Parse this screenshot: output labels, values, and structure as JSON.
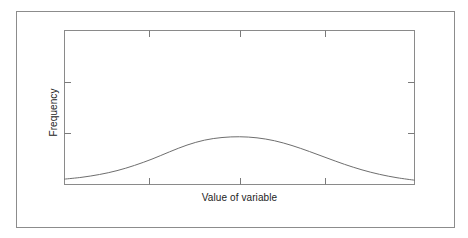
{
  "figure": {
    "background_color": "#ffffff",
    "outer_border_color": "#8c8c8c",
    "axis_color": "#8a8a8a",
    "curve_color": "#6e6e6e",
    "text_color": "#1c1c1c"
  },
  "chart_data": {
    "type": "line",
    "title": "",
    "subtitle": "",
    "xlabel": "Value of variable",
    "ylabel": "Frequency",
    "legend": [],
    "annotations": [],
    "grid": false,
    "frame": "full-box",
    "tick_direction": "in",
    "tick_labels_x": [],
    "tick_labels_y": [],
    "xlim": [
      0,
      1
    ],
    "ylim": [
      0,
      1
    ],
    "x_tick_positions": [
      0.242,
      0.501,
      0.743
    ],
    "y_tick_positions": [
      0.665,
      0.335
    ],
    "series": [
      {
        "name": "frequency distribution",
        "x": [
          0.0,
          0.05,
          0.1,
          0.15,
          0.2,
          0.25,
          0.3,
          0.35,
          0.4,
          0.45,
          0.5,
          0.55,
          0.6,
          0.65,
          0.7,
          0.75,
          0.8,
          0.85,
          0.9,
          0.95,
          1.0
        ],
        "values": [
          0.035,
          0.047,
          0.065,
          0.09,
          0.124,
          0.165,
          0.212,
          0.256,
          0.288,
          0.305,
          0.31,
          0.303,
          0.284,
          0.253,
          0.214,
          0.172,
          0.131,
          0.095,
          0.066,
          0.044,
          0.028
        ]
      }
    ]
  }
}
